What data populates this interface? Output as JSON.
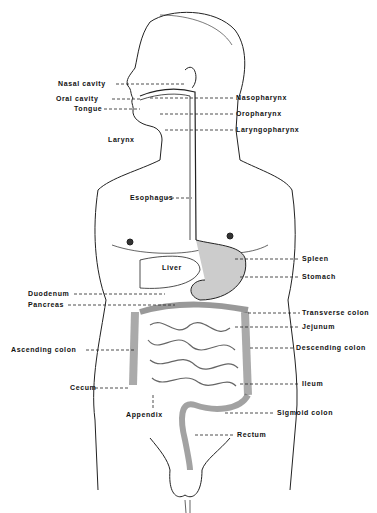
{
  "diagram": {
    "labels_left": [
      {
        "text": "Nasal cavity",
        "x": 58,
        "y": 81
      },
      {
        "text": "Oral cavity",
        "x": 56,
        "y": 96
      },
      {
        "text": "Tongue",
        "x": 74,
        "y": 106
      },
      {
        "text": "Larynx",
        "x": 108,
        "y": 137
      },
      {
        "text": "Esophagus",
        "x": 130,
        "y": 195
      },
      {
        "text": "Liver",
        "x": 162,
        "y": 265
      },
      {
        "text": "Duodenum",
        "x": 28,
        "y": 291
      },
      {
        "text": "Pancreas",
        "x": 28,
        "y": 302
      },
      {
        "text": "Ascending colon",
        "x": 11,
        "y": 347
      },
      {
        "text": "Cecum",
        "x": 70,
        "y": 385
      },
      {
        "text": "Appendix",
        "x": 126,
        "y": 412
      }
    ],
    "labels_right": [
      {
        "text": "Nasopharynx",
        "x": 236,
        "y": 95
      },
      {
        "text": "Oropharynx",
        "x": 236,
        "y": 111
      },
      {
        "text": "Laryngopharynx",
        "x": 236,
        "y": 127
      },
      {
        "text": "Spleen",
        "x": 302,
        "y": 256
      },
      {
        "text": "Stomach",
        "x": 302,
        "y": 274
      },
      {
        "text": "Transverse colon",
        "x": 302,
        "y": 310
      },
      {
        "text": "Jejunum",
        "x": 302,
        "y": 324
      },
      {
        "text": "Descending colon",
        "x": 296,
        "y": 345
      },
      {
        "text": "Ileum",
        "x": 302,
        "y": 381
      },
      {
        "text": "Sigmoid colon",
        "x": 277,
        "y": 410
      },
      {
        "text": "Rectum",
        "x": 237,
        "y": 432
      }
    ]
  }
}
